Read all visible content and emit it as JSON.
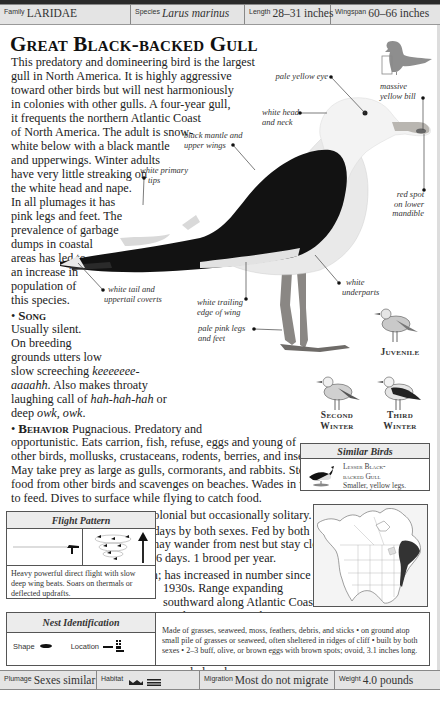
{
  "header": {
    "family": {
      "label": "Family",
      "value": "LARIDAE"
    },
    "species": {
      "label": "Species",
      "value": "Larus marinus"
    },
    "length": {
      "label": "Length",
      "value": "28–31 inches"
    },
    "wingspan": {
      "label": "Wingspan",
      "value": "60–66 inches"
    }
  },
  "title": "Great Black-backed Gull",
  "intro_lines": [
    "This predatory and domineering bird is the largest",
    "gull in North America. It is highly aggressive",
    "toward other birds but will nest harmoniously",
    "in colonies with other gulls. A four-year gull,",
    "it frequents the northern Atlantic Coast",
    "of North America. The adult is snow-",
    "white below with a black mantle",
    "and upperwings. Winter adults",
    "have very little streaking on",
    "the white head and nape.",
    "In all plumages it has",
    "pink legs and feet. The",
    "prevalence of garbage",
    "dumps in coastal",
    "areas has led to",
    "an increase in",
    "population of",
    "this species."
  ],
  "song": {
    "heading": "Song",
    "lines": [
      "Usually silent.",
      "On breeding",
      "grounds utters low",
      "slow screeching",
      "aaaahh. Also makes throaty",
      "laughing call of",
      "deep"
    ],
    "call1": "keeeeeee-",
    "call2": "aaaahh",
    "call3": "hah-hah-hah",
    "call4": "owk, owk",
    "or": "or",
    "also": ". Also makes throaty"
  },
  "annotations": {
    "pale_yellow_eye": "pale yellow eye",
    "massive_yellow_bill": [
      "massive",
      "yellow bill"
    ],
    "white_head": [
      "white head",
      "and neck"
    ],
    "black_mantle": [
      "black mantle and",
      "upper wings"
    ],
    "white_primary": [
      "white primary",
      "tips"
    ],
    "red_spot": [
      "red spot",
      "on lower",
      "mandible"
    ],
    "white_underparts": [
      "white",
      "underparts"
    ],
    "white_tail": [
      "white tail and",
      "uppertail coverts"
    ],
    "white_trailing": [
      "white trailing",
      "edge of wing"
    ],
    "pale_pink_legs": [
      "pale pink legs",
      "and feet"
    ]
  },
  "stages": {
    "juvenile": "Juvenile",
    "second_winter": [
      "Second",
      "Winter"
    ],
    "third_winter": [
      "Third",
      "Winter"
    ]
  },
  "behavior": {
    "heading": "Behavior",
    "lines": [
      "Pugnacious. Predatory and",
      "opportunistic. Eats carrion, fish, refuse, eggs and young of",
      "other birds, mollusks, crustaceans, rodents, berries, and insects.",
      "May take prey as large as gulls, cormorants, and rabbits. Steals",
      "food from other birds and scavenges on beaches. Wades in water",
      "to feed. Dives to surface while flying to catch food."
    ]
  },
  "breeding": {
    "heading": "Breeding",
    "text": "Monogamous. Colonial but occasionally solitary."
  },
  "nesting": {
    "heading": "Nesting",
    "lines": [
      "Incubation 26–29 days by both sexes. Fed by both",
      "sexes. Semiprecocial young may wander from nest but stay close",
      "to parents. First flight at 49–56 days. 1 brood per year."
    ]
  },
  "population": {
    "heading": "Population",
    "first": "Fairly common; has increased in number since",
    "lines": [
      "1930s. Range expanding",
      "southward along Atlantic Coast.",
      "Fairly common on the eastern",
      "Great Lakes but rare on the",
      "western ones; casual inland in",
      "the East in winter; accidental to",
      "casual elsewhere."
    ]
  },
  "similar_birds": {
    "title": "Similar Birds",
    "name_lines": [
      "Lesser Black-",
      "backed Gull"
    ],
    "desc": "Smaller, yellow legs."
  },
  "flight_pattern": {
    "title": "Flight Pattern",
    "desc": "Heavy powerful direct flight with slow deep wing beats. Soars on thermals or deflected updrafts."
  },
  "nest_identification": {
    "title": "Nest Identification",
    "shape_label": "Shape",
    "location_label": "Location",
    "text": "Made of grasses, seaweed, moss, feathers, debris, and sticks • on ground atop small pile of grasses or seaweed, often sheltered in ridges of cliff • built by both sexes • 2–3 buff, olive, or brown eggs with brown spots; ovoid, 3.1 inches long."
  },
  "footer": {
    "plumage": {
      "label": "Plumage",
      "value": "Sexes similar"
    },
    "habitat": {
      "label": "Habitat"
    },
    "migration": {
      "label": "Migration",
      "value": "Most do not migrate"
    },
    "weight": {
      "label": "Weight",
      "value": "4.0 pounds"
    }
  },
  "colors": {
    "bar_bg": "#e4e4e4",
    "ink": "#1a1a1a",
    "range_fill": "#333333"
  }
}
